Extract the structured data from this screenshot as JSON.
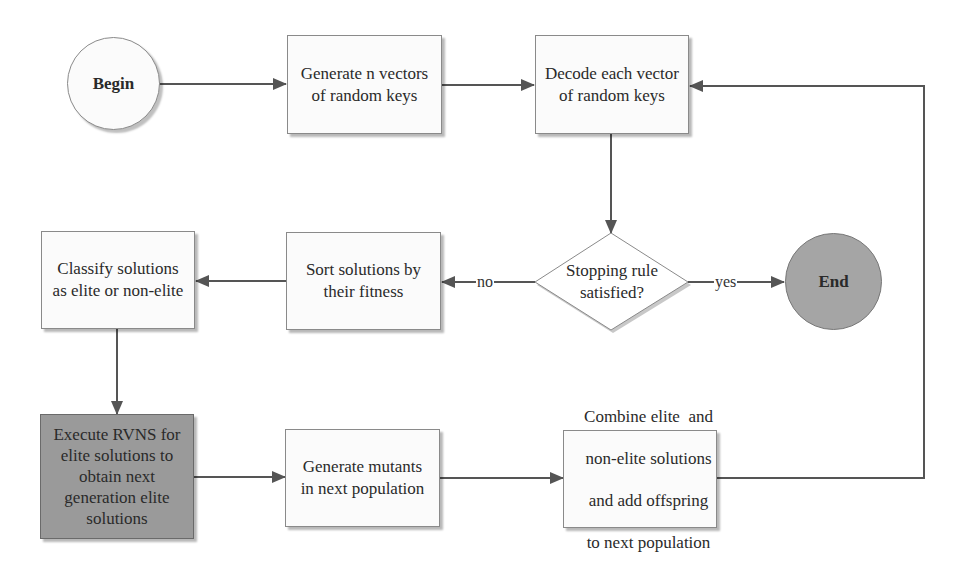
{
  "diagram": {
    "type": "flowchart",
    "nodes": {
      "begin": {
        "label": "Begin",
        "shape": "circle",
        "fill": "#fbfbfb"
      },
      "generate_vectors": {
        "label": "Generate n vectors of random keys",
        "lines": [
          "Generate n vectors",
          "of random keys"
        ],
        "shape": "rectangle"
      },
      "decode": {
        "label": "Decode each vector of random keys",
        "lines": [
          "Decode each vector",
          "of random keys"
        ],
        "shape": "rectangle"
      },
      "stopping_rule": {
        "label": "Stopping rule satisfied?",
        "lines": [
          "Stopping rule",
          "satisfied?"
        ],
        "shape": "diamond"
      },
      "end": {
        "label": "End",
        "shape": "circle",
        "fill": "#a5a5a5"
      },
      "sort": {
        "label": "Sort solutions by their fitness",
        "lines": [
          "Sort solutions by",
          "their fitness"
        ],
        "shape": "rectangle"
      },
      "classify": {
        "label": "Classify solutions as elite or non-elite",
        "lines": [
          "Classify solutions",
          "as elite or non-elite"
        ],
        "shape": "rectangle"
      },
      "execute_rvns": {
        "label": "Execute RVNS for elite solutions to obtain next generation elite solutions",
        "lines": [
          "Execute RVNS for",
          "elite solutions to",
          "obtain next",
          "generation elite",
          "solutions"
        ],
        "shape": "rectangle",
        "fill": "#9a9a9a"
      },
      "generate_mutants": {
        "label": "Generate mutants in next population",
        "lines": [
          "Generate mutants",
          "in next population"
        ],
        "shape": "rectangle"
      },
      "combine": {
        "label": "Combine elite and non-elite solutions and add offspring to next population",
        "lines": [
          "Combine elite  and",
          "non-elite solutions",
          "and add offspring",
          "to next population"
        ],
        "shape": "rectangle"
      }
    },
    "edges": [
      {
        "from": "begin",
        "to": "generate_vectors",
        "label": ""
      },
      {
        "from": "generate_vectors",
        "to": "decode",
        "label": ""
      },
      {
        "from": "decode",
        "to": "stopping_rule",
        "label": ""
      },
      {
        "from": "stopping_rule",
        "to": "end",
        "label": "yes"
      },
      {
        "from": "stopping_rule",
        "to": "sort",
        "label": "no"
      },
      {
        "from": "sort",
        "to": "classify",
        "label": ""
      },
      {
        "from": "classify",
        "to": "execute_rvns",
        "label": ""
      },
      {
        "from": "execute_rvns",
        "to": "generate_mutants",
        "label": ""
      },
      {
        "from": "generate_mutants",
        "to": "combine",
        "label": ""
      },
      {
        "from": "combine",
        "to": "decode",
        "label": ""
      }
    ],
    "edge_labels": {
      "yes": "yes",
      "no": "no"
    },
    "colors": {
      "line": "#555555",
      "box_border": "#8a8a8a",
      "dark_fill": "#9a9a9a",
      "end_fill": "#a5a5a5"
    }
  }
}
